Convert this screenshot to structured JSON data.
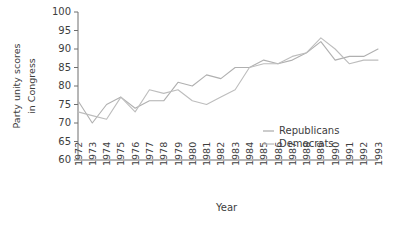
{
  "chart_data": {
    "type": "line",
    "title": "",
    "xlabel": "Year",
    "ylabel": "Party unity scores in Congress",
    "ylabel_line1": "Party unity scores",
    "ylabel_line2": "in Congress",
    "x": [
      1972,
      1973,
      1974,
      1975,
      1976,
      1977,
      1978,
      1979,
      1980,
      1981,
      1982,
      1983,
      1984,
      1985,
      1986,
      1987,
      1988,
      1989,
      1990,
      1991,
      1992,
      1993
    ],
    "categories": [
      "1972",
      "1973",
      "1974",
      "1975",
      "1976",
      "1977",
      "1978",
      "1979",
      "1980",
      "1981",
      "1982",
      "1983",
      "1984",
      "1985",
      "1986",
      "1987",
      "1988",
      "1989",
      "1990",
      "1991",
      "1992",
      "1993"
    ],
    "xlim": [
      1972,
      1993
    ],
    "ylim": [
      60,
      100
    ],
    "yticks": [
      60,
      65,
      70,
      75,
      80,
      85,
      90,
      95,
      100
    ],
    "ytick_labels": [
      "60",
      "65",
      "70",
      "75",
      "80",
      "85",
      "90",
      "95",
      "100"
    ],
    "grid": false,
    "legend_position": "inside-right-lower",
    "series": [
      {
        "name": "Republicans",
        "color": "#b0b0b0",
        "values": [
          76,
          70,
          75,
          77,
          74,
          76,
          76,
          81,
          80,
          83,
          82,
          85,
          85,
          87,
          86,
          87,
          89,
          92,
          87,
          88,
          88,
          90
        ]
      },
      {
        "name": "Democrats",
        "color": "#bdbdbd",
        "values": [
          73,
          72,
          71,
          77,
          73,
          79,
          78,
          79,
          76,
          75,
          77,
          79,
          85,
          86,
          86,
          88,
          89,
          93,
          90,
          86,
          87,
          87
        ]
      }
    ]
  },
  "legend": {
    "entries": [
      {
        "label": "Republicans"
      },
      {
        "label": "Democrats"
      }
    ]
  },
  "axes": {
    "x_title": "Year",
    "y_title_line1": "Party unity scores",
    "y_title_line2": "in Congress"
  }
}
